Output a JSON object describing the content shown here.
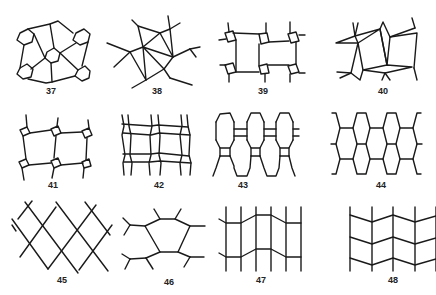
{
  "figures": [
    {
      "number": "37",
      "description": "tiling with hexagons at corners and center, connected by radiating lines"
    },
    {
      "number": "38",
      "description": "star-like arrangement of triangles with radiating line segments"
    },
    {
      "number": "39",
      "description": "two rectangular cells joined by small squares at corners with stub lines"
    },
    {
      "number": "40",
      "description": "rhombi and squares arranged around a central quadrilateral with stub lines"
    },
    {
      "number": "41",
      "description": "two tilted squares joined by small diamond squares at corners"
    },
    {
      "number": "42",
      "description": "grid of doubled lines forming a wavy lattice"
    },
    {
      "number": "43",
      "description": "staggered elongated hexagons linked by small rectangles"
    },
    {
      "number": "44",
      "description": "honeycomb of elongated hexagons"
    },
    {
      "number": "45",
      "description": "diagonal lattice of crossing lines forming diamonds"
    },
    {
      "number": "46",
      "description": "single large hexagon with branching stub lines at vertices"
    },
    {
      "number": "47",
      "description": "vertical lines crossed by two bent horizontal polylines"
    },
    {
      "number": "48",
      "description": "vertical lines crossed by three zigzag horizontal polylines"
    }
  ]
}
